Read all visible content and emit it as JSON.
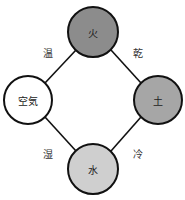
{
  "diagram": {
    "type": "four-elements-qualities",
    "nodes": [
      {
        "id": "fire",
        "label": "火",
        "cx": 93,
        "cy": 32,
        "r": 25,
        "fill": "#8c8c8c"
      },
      {
        "id": "air",
        "label": "空気",
        "cx": 28,
        "cy": 100,
        "r": 24,
        "fill": "#ffffff"
      },
      {
        "id": "earth",
        "label": "土",
        "cx": 158,
        "cy": 100,
        "r": 24,
        "fill": "#a6a6a6"
      },
      {
        "id": "water",
        "label": "水",
        "cx": 93,
        "cy": 169,
        "r": 25,
        "fill": "#cfcfcf"
      }
    ],
    "edges": [
      {
        "from": "air",
        "to": "fire",
        "label": "温"
      },
      {
        "from": "fire",
        "to": "earth",
        "label": "乾"
      },
      {
        "from": "air",
        "to": "water",
        "label": "湿"
      },
      {
        "from": "water",
        "to": "earth",
        "label": "冷"
      }
    ]
  }
}
